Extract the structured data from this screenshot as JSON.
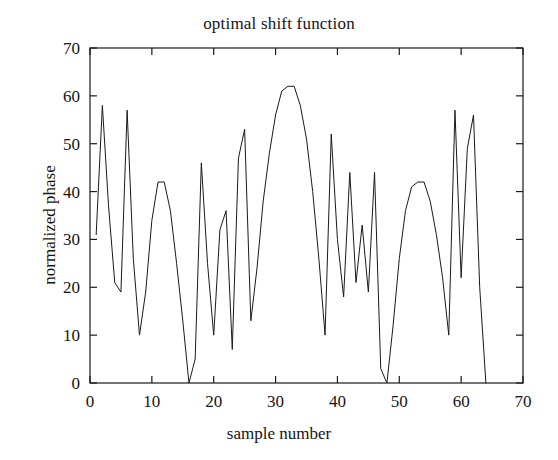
{
  "chart_data": {
    "type": "line",
    "title": "optimal shift function",
    "xlabel": "sample number",
    "ylabel": "normalized phase",
    "xlim": [
      0,
      70
    ],
    "ylim": [
      0,
      70
    ],
    "xticks": [
      0,
      10,
      20,
      30,
      40,
      50,
      60,
      70
    ],
    "yticks": [
      0,
      10,
      20,
      30,
      40,
      50,
      60,
      70
    ],
    "grid": false,
    "legend": null,
    "line_color": "#1a1a1a",
    "line_width": 1,
    "series": [
      {
        "name": "optimal shift function",
        "x": [
          1,
          2,
          3,
          4,
          5,
          6,
          7,
          8,
          9,
          10,
          11,
          12,
          13,
          14,
          15,
          16,
          17,
          18,
          19,
          20,
          21,
          22,
          23,
          24,
          25,
          26,
          27,
          28,
          29,
          30,
          31,
          32,
          33,
          34,
          35,
          36,
          37,
          38,
          39,
          40,
          41,
          42,
          43,
          44,
          45,
          46,
          47,
          48,
          49,
          50,
          51,
          52,
          53,
          54,
          55,
          56,
          57,
          58,
          59,
          60,
          61,
          62,
          63,
          64
        ],
        "values": [
          31,
          58,
          37,
          21,
          19,
          57,
          26,
          10,
          19,
          34,
          42,
          42,
          36,
          25,
          13,
          0,
          5,
          46,
          25,
          10,
          32,
          36,
          7,
          47,
          53,
          13,
          24,
          38,
          48,
          56,
          61,
          62,
          62,
          58,
          51,
          40,
          26,
          10,
          52,
          30,
          18,
          44,
          21,
          33,
          19,
          44,
          3,
          0,
          12,
          26,
          36,
          41,
          42,
          42,
          38,
          31,
          22,
          10,
          57,
          22,
          49,
          56,
          20,
          0
        ]
      }
    ]
  }
}
